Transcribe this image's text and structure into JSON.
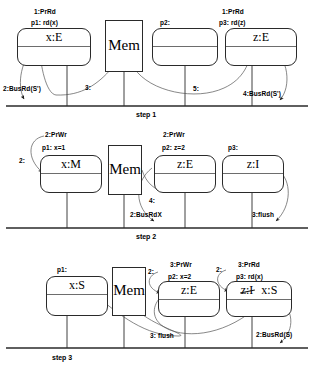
{
  "diagram": {
    "type": "three-step cache coherence state diagram",
    "memory_label": "Mem",
    "line_color": "#2a2a2a"
  },
  "steps": [
    {
      "name": "step 1",
      "label": "step 1",
      "caches": [
        {
          "proc": "p1: rd(x)",
          "event": "1:PrRd",
          "state": "x:E",
          "struck": false
        },
        {
          "proc": "",
          "event": "",
          "state": "",
          "struck": false
        },
        {
          "proc": "p2:",
          "event": "",
          "state": "",
          "struck": false
        },
        {
          "proc": "p3: rd(z)",
          "event": "1:PrRd",
          "state": "z:E",
          "struck": false
        }
      ],
      "bus_labels": [
        {
          "text": "2:BusRd(S')"
        },
        {
          "text": "3:"
        },
        {
          "text": "5:"
        },
        {
          "text": "4:BusRd(S')"
        }
      ]
    },
    {
      "name": "step 2",
      "label": "step 2",
      "caches": [
        {
          "proc": "p1: x=1",
          "event": "2:PrWr",
          "state": "x:M",
          "struck": false
        },
        {
          "proc": "",
          "event": "",
          "state": "",
          "struck": false
        },
        {
          "proc": "p2: z=2",
          "event": "2:PrWr",
          "state": "z:E",
          "struck": false
        },
        {
          "proc": "p3:",
          "event": "",
          "state": "z:I",
          "struck": false
        }
      ],
      "bus_labels": [
        {
          "text": "2:"
        },
        {
          "text": "4:"
        },
        {
          "text": "2:BusRdX"
        },
        {
          "text": "3:flush"
        }
      ]
    },
    {
      "name": "step 3",
      "label": "step 3",
      "caches": [
        {
          "proc": "p1:",
          "event": "",
          "state": "x:S",
          "struck": false
        },
        {
          "proc": "",
          "event": "",
          "state": "",
          "struck": false
        },
        {
          "proc": "p2: x=2",
          "event": "3:PrWr",
          "state": "z:E",
          "struck": false
        },
        {
          "proc": "p3: rd(x)",
          "event": "3:PrRd",
          "state": "z:I",
          "state2": "x:S",
          "struck": true
        }
      ],
      "bus_labels": [
        {
          "text": "2:"
        },
        {
          "text": "2:"
        },
        {
          "text": "3: flush"
        },
        {
          "text": "2:BusRd(S)"
        }
      ]
    }
  ]
}
